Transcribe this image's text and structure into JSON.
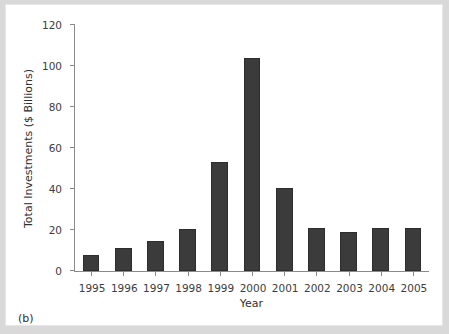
{
  "figure": {
    "caption": "(b)",
    "background_color": "#d9d9d9",
    "panel_color": "#ffffff",
    "bar_color": "#3b3b3b",
    "axis_color": "#8a8a8a"
  },
  "chart_data": {
    "type": "bar",
    "title": "",
    "xlabel": "Year",
    "ylabel": "Total Investments ($ Billions)",
    "categories": [
      "1995",
      "1996",
      "1997",
      "1998",
      "1999",
      "2000",
      "2001",
      "2002",
      "2003",
      "2004",
      "2005"
    ],
    "values": [
      8,
      11,
      14.5,
      20.5,
      53,
      104,
      40.5,
      21,
      19,
      21,
      21
    ],
    "ylim": [
      0,
      120
    ],
    "ytick_values": [
      0,
      20,
      40,
      60,
      80,
      100,
      120
    ],
    "ytick_labels": [
      "0",
      "20",
      "40",
      "60",
      "80",
      "100",
      "120"
    ],
    "grid": false,
    "legend": null,
    "legend_position": "none",
    "series": [
      {
        "name": "Total Investments",
        "values": [
          8,
          11,
          14.5,
          20.5,
          53,
          104,
          40.5,
          21,
          19,
          21,
          21
        ]
      }
    ]
  }
}
